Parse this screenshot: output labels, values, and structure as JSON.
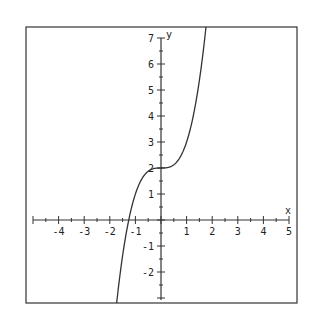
{
  "chart_data": {
    "type": "line",
    "title": "",
    "function": "y = x^3 + 2",
    "xlabel": "x",
    "ylabel": "y",
    "xlim": [
      -5,
      5
    ],
    "ylim": [
      -3,
      7
    ],
    "x_ticks": [
      -4,
      -3,
      -2,
      -1,
      1,
      2,
      3,
      4,
      5
    ],
    "y_ticks": [
      -2,
      -1,
      1,
      2,
      3,
      4,
      5,
      6,
      7
    ],
    "minor_tick_step": 0.5,
    "grid": false,
    "legend": null,
    "series": [
      {
        "name": "f(x)",
        "x": [
          -1.71,
          -1.5,
          -1.26,
          -1.0,
          -0.75,
          -0.5,
          -0.25,
          0,
          0.25,
          0.5,
          0.75,
          1.0,
          1.25,
          1.5,
          1.75
        ],
        "values": [
          -3.0,
          -1.38,
          0.0,
          1.0,
          1.58,
          1.88,
          1.98,
          2.0,
          2.02,
          2.13,
          2.42,
          3.0,
          3.95,
          5.38,
          7.36
        ]
      }
    ],
    "color": "#333333"
  },
  "labels": {
    "x_axis": "x",
    "y_axis": "y",
    "x_ticks": [
      "-4",
      "-3",
      "-2",
      "-1",
      "1",
      "2",
      "3",
      "4",
      "5"
    ],
    "y_ticks": [
      "-2",
      "-1",
      "1",
      "2",
      "3",
      "4",
      "5",
      "6",
      "7"
    ]
  }
}
